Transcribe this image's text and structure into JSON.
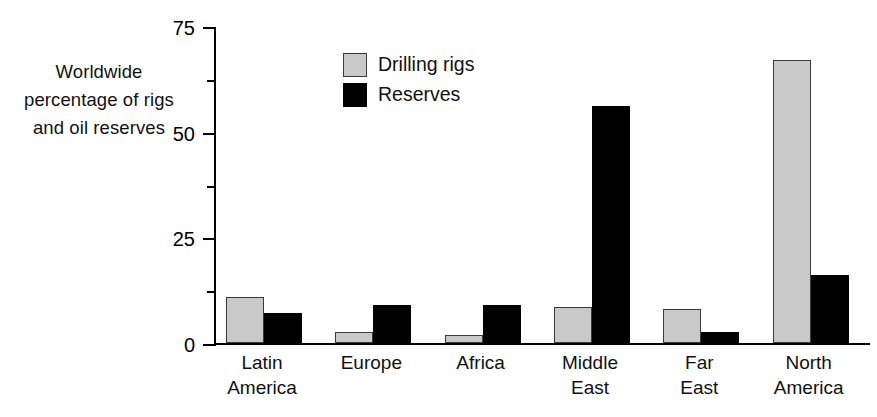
{
  "axis_caption": {
    "line1": "Worldwide",
    "line2": "percentage of rigs",
    "line3": "and oil reserves"
  },
  "legend": {
    "items": [
      {
        "label": "Drilling rigs",
        "swatch": "light-gray-swatch",
        "color": "#c9c9c9"
      },
      {
        "label": "Reserves",
        "swatch": "black-swatch",
        "color": "#000000"
      }
    ]
  },
  "y_ticks": [
    {
      "value": 75,
      "label": "75",
      "major": true
    },
    {
      "value": 62.5,
      "label": "",
      "major": false
    },
    {
      "value": 50,
      "label": "50",
      "major": true
    },
    {
      "value": 37.5,
      "label": "",
      "major": false
    },
    {
      "value": 25,
      "label": "25",
      "major": true
    },
    {
      "value": 12.5,
      "label": "",
      "major": false
    },
    {
      "value": 0,
      "label": "0",
      "major": true
    }
  ],
  "category_labels": [
    {
      "line1": "Latin",
      "line2": "America"
    },
    {
      "line1": "Europe",
      "line2": ""
    },
    {
      "line1": "Africa",
      "line2": ""
    },
    {
      "line1": "Middle",
      "line2": "East"
    },
    {
      "line1": "Far",
      "line2": "East"
    },
    {
      "line1": "North",
      "line2": "America"
    }
  ],
  "chart_data": {
    "type": "bar",
    "title": "",
    "xlabel": "",
    "ylabel": "Worldwide percentage of rigs and oil reserves",
    "ylim": [
      0,
      75
    ],
    "ytick_values": [
      0,
      25,
      50,
      75
    ],
    "yminor_tick_values": [
      12.5,
      37.5,
      62.5
    ],
    "grid": false,
    "legend_position": "inside-top-left",
    "categories": [
      "Latin America",
      "Europe",
      "Africa",
      "Middle East",
      "Far East",
      "North America"
    ],
    "series": [
      {
        "name": "Drilling rigs",
        "color": "#c9c9c9",
        "values": [
          11,
          2.5,
          2,
          8.5,
          8,
          67
        ]
      },
      {
        "name": "Reserves",
        "color": "#000000",
        "values": [
          7,
          9,
          9,
          56,
          2.5,
          16
        ]
      }
    ]
  }
}
